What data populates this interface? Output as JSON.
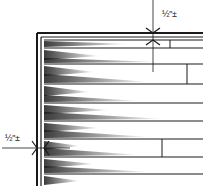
{
  "diagram": {
    "type": "architectural-detail",
    "labels": {
      "top_gap": "½\"±",
      "left_gap": "½\"±"
    },
    "colors": {
      "ink": "#1a1a1a",
      "background": "#ffffff"
    },
    "board_lines_y": [
      40,
      48,
      64,
      84,
      103,
      121,
      139,
      157,
      174
    ],
    "board_joints": [
      {
        "x": 170,
        "y1": 40,
        "y2": 48
      },
      {
        "x": 187,
        "y1": 64,
        "y2": 84
      },
      {
        "x": 162,
        "y1": 139,
        "y2": 157
      }
    ]
  }
}
